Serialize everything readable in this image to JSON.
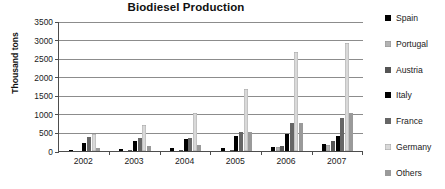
{
  "chart_data": {
    "type": "bar",
    "title": "Biodiesel Production",
    "xlabel": "",
    "ylabel": "Thousand tons",
    "categories": [
      "2002",
      "2003",
      "2004",
      "2005",
      "2006",
      "2007"
    ],
    "ylim": [
      0,
      3500
    ],
    "yticks": [
      0,
      500,
      1000,
      1500,
      2000,
      2500,
      3000,
      3500
    ],
    "ytick_labels": [
      "0",
      "500",
      "1000",
      "1500",
      "2000",
      "2500",
      "3000",
      "3500"
    ],
    "grid": "horizontal",
    "legend_position": "right",
    "series": [
      {
        "name": "Spain",
        "color": "#000000",
        "values": [
          20,
          45,
          70,
          70,
          120,
          190
        ]
      },
      {
        "name": "Portugal",
        "color": "#b3b3b3",
        "values": [
          0,
          0,
          0,
          0,
          100,
          170
        ]
      },
      {
        "name": "Austria",
        "color": "#555555",
        "values": [
          0,
          30,
          20,
          30,
          130,
          270
        ]
      },
      {
        "name": "Italy",
        "color": "#000000",
        "values": [
          210,
          270,
          320,
          400,
          470,
          410
        ]
      },
      {
        "name": "France",
        "color": "#666666",
        "values": [
          370,
          350,
          360,
          510,
          760,
          900
        ]
      },
      {
        "name": "Germany",
        "color": "#d9d9d9",
        "values": [
          450,
          700,
          1020,
          1670,
          2660,
          2900
        ]
      },
      {
        "name": "Others",
        "color": "#9a9a9a",
        "values": [
          70,
          130,
          160,
          520,
          750,
          1020
        ]
      }
    ]
  }
}
